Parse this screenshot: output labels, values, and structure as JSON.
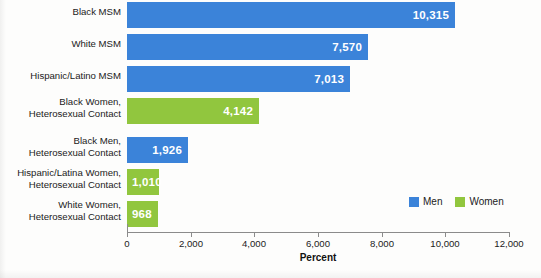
{
  "chart_data": {
    "type": "bar",
    "orientation": "horizontal",
    "title": "",
    "xlabel": "Percent",
    "ylabel": "",
    "xlim": [
      0,
      12000
    ],
    "grid": false,
    "legend_position": "bottom-right",
    "categories": [
      "Black MSM",
      "White MSM",
      "Hispanic/Latino MSM",
      "Black Women,\nHeterosexual Contact",
      "Black Men,\nHeterosexual Contact",
      "Hispanic/Latina Women,\nHeterosexual Contact",
      "White Women,\nHeterosexual Contact"
    ],
    "values": [
      10315,
      7570,
      7013,
      4142,
      1926,
      1010,
      968
    ],
    "value_labels": [
      "10,315",
      "7,570",
      "7,013",
      "4,142",
      "1,926",
      "1,010",
      "968"
    ],
    "series_of_bar": [
      "Men",
      "Men",
      "Men",
      "Women",
      "Men",
      "Women",
      "Women"
    ],
    "series": [
      {
        "name": "Men",
        "color": "#3b83d9"
      },
      {
        "name": "Women",
        "color": "#91c63e"
      }
    ],
    "xticks": [
      0,
      2000,
      4000,
      6000,
      8000,
      10000,
      12000
    ],
    "xtick_labels": [
      "0",
      "2,000",
      "4,000",
      "6,000",
      "8,000",
      "10,000",
      "12,000"
    ]
  },
  "legend": {
    "items": [
      {
        "label": "Men",
        "color": "#3b83d9"
      },
      {
        "label": "Women",
        "color": "#91c63e"
      }
    ]
  },
  "axis": {
    "x_title": "Percent"
  }
}
